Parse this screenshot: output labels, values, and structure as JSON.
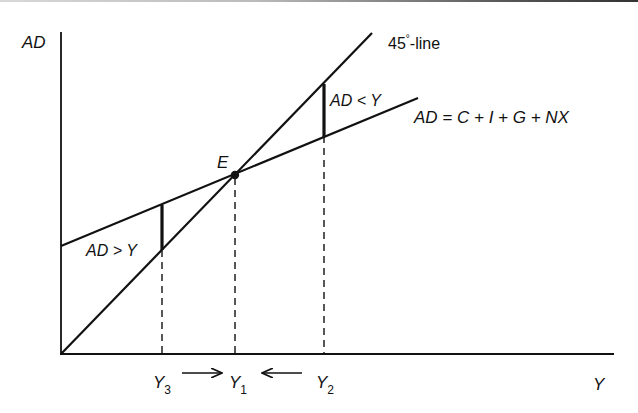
{
  "diagram": {
    "axes": {
      "y_label": "AD",
      "x_label": "Y"
    },
    "lines": {
      "forty_five": {
        "label_main": "45",
        "label_deg": "°",
        "label_suffix": "-line"
      },
      "ad": {
        "label": "AD = C + I + G + NX"
      }
    },
    "equilibrium": {
      "label": "E"
    },
    "gaps": {
      "excess_demand": "AD > Y",
      "excess_supply": "AD < Y"
    },
    "x_ticks": [
      {
        "base": "Y",
        "sub": "3"
      },
      {
        "base": "Y",
        "sub": "1"
      },
      {
        "base": "Y",
        "sub": "2"
      }
    ],
    "colors": {
      "ink": "#111111",
      "background": "#ffffff"
    }
  }
}
